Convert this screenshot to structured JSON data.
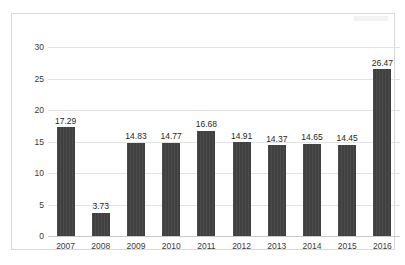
{
  "chart_data": {
    "type": "bar",
    "title": "",
    "subtitle": "",
    "xlabel": "",
    "ylabel": "",
    "categories": [
      "2007",
      "2008",
      "2009",
      "2010",
      "2011",
      "2012",
      "2013",
      "2014",
      "2015",
      "2016"
    ],
    "values": [
      17.29,
      3.73,
      14.83,
      14.77,
      16.68,
      14.91,
      14.37,
      14.65,
      14.45,
      26.47
    ],
    "data_labels": [
      "17.29",
      "3.73",
      "14.83",
      "14.77",
      "16.68",
      "14.91",
      "14.37",
      "14.65",
      "14.45",
      "26.47"
    ],
    "ylim": [
      0,
      30
    ],
    "ytick_values": [
      0,
      5,
      10,
      15,
      20,
      25,
      30
    ],
    "ytick_labels": [
      "0",
      "5",
      "10",
      "15",
      "20",
      "25",
      "30"
    ],
    "grid": true,
    "grid_axis": "y",
    "legend": false,
    "legend_position": "none",
    "series": [
      {
        "name": "",
        "values": [
          17.29,
          3.73,
          14.83,
          14.77,
          16.68,
          14.91,
          14.37,
          14.65,
          14.45,
          26.47
        ]
      }
    ]
  },
  "style": {
    "bar_color": "#404040",
    "gridline_color": "#e3e3e3",
    "axis_color": "#c9c9c9",
    "frame_color": "#d9d9d9",
    "label_color": "#1f1f1f",
    "tick_color": "#3a3a3a",
    "background": "#ffffff"
  }
}
